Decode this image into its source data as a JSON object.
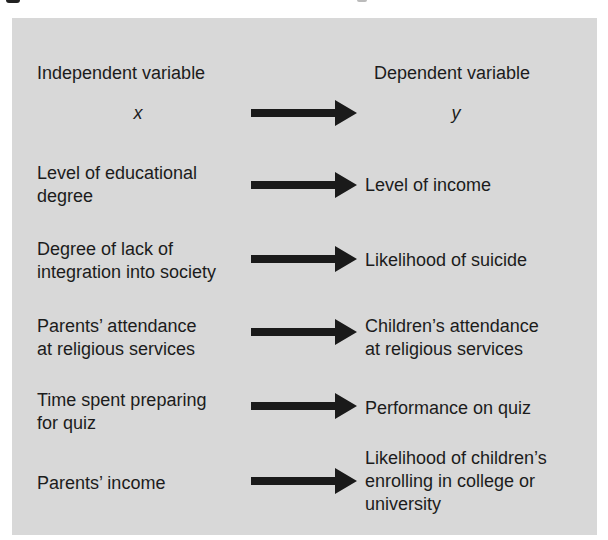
{
  "diagram": {
    "headers": {
      "independent": "Independent variable",
      "dependent": "Dependent variable"
    },
    "symbols": {
      "independent": "x",
      "dependent": "y"
    },
    "colors": {
      "panel_background": "#d8d8d8",
      "text": "#1c1c1c",
      "arrow": "#1a1a1a"
    },
    "rows": [
      {
        "independent": [
          "Level of educational",
          "degree"
        ],
        "dependent": [
          "Level of income"
        ]
      },
      {
        "independent": [
          "Degree of lack of",
          "integration into society"
        ],
        "dependent": [
          "Likelihood of suicide"
        ]
      },
      {
        "independent": [
          "Parents’ attendance",
          "at religious services"
        ],
        "dependent": [
          "Children’s attendance",
          "at religious services"
        ]
      },
      {
        "independent": [
          "Time spent preparing",
          "for quiz"
        ],
        "dependent": [
          "Performance on quiz"
        ]
      },
      {
        "independent": [
          "Parents’ income"
        ],
        "dependent": [
          "Likelihood of children’s",
          "enrolling in college or",
          "university"
        ]
      }
    ]
  }
}
